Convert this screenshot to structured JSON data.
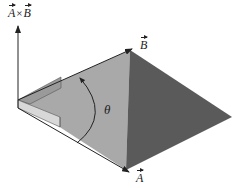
{
  "figure": {
    "type": "vector-cross-product-diagram",
    "labels": {
      "cross_product": {
        "left": "A",
        "operator": "×",
        "right": "B"
      },
      "vector_b": "B",
      "vector_a": "A",
      "angle": "θ"
    },
    "colors": {
      "background": "#ffffff",
      "parallelogram_light": "#a9a9a9",
      "parallelogram_dark": "#5a5a5a",
      "plane_face": "#9a9a9a",
      "plane_face_light": "#d8d8d8",
      "line": "#222222"
    }
  }
}
